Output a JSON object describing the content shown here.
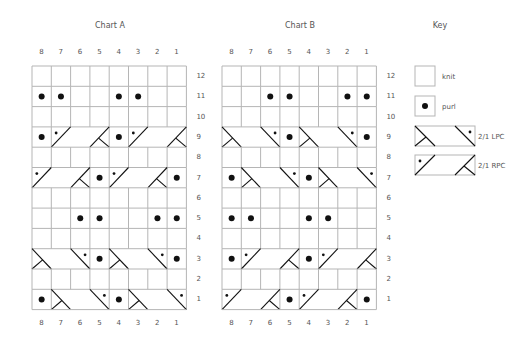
{
  "charts": [
    {
      "title": "Chart A",
      "columns": [
        "8",
        "7",
        "6",
        "5",
        "4",
        "3",
        "2",
        "1"
      ],
      "rows": [
        {
          "row": 12,
          "stitches": [
            "k",
            "k",
            "k",
            "k",
            "k",
            "k",
            "k",
            "k"
          ]
        },
        {
          "row": 11,
          "stitches": [
            "p",
            "p",
            "k",
            "k",
            "p",
            "p",
            "k",
            "k"
          ]
        },
        {
          "row": 10,
          "stitches": [
            "k",
            "k",
            "k",
            "k",
            "k",
            "k",
            "k",
            "k"
          ]
        },
        {
          "row": 9,
          "stitches": [
            "p",
            "RPC",
            "",
            "",
            "p",
            "RPC",
            "",
            ""
          ]
        },
        {
          "row": 8,
          "stitches": [
            "k",
            "k",
            "k",
            "k",
            "k",
            "k",
            "k",
            "k"
          ]
        },
        {
          "row": 7,
          "stitches": [
            "RPC",
            "",
            "",
            "p",
            "RPC",
            "",
            "",
            "p"
          ]
        },
        {
          "row": 6,
          "stitches": [
            "k",
            "k",
            "k",
            "k",
            "k",
            "k",
            "k",
            "k"
          ]
        },
        {
          "row": 5,
          "stitches": [
            "k",
            "k",
            "p",
            "p",
            "k",
            "k",
            "p",
            "p"
          ]
        },
        {
          "row": 4,
          "stitches": [
            "k",
            "k",
            "k",
            "k",
            "k",
            "k",
            "k",
            "k"
          ]
        },
        {
          "row": 3,
          "stitches": [
            "LPC",
            "",
            "",
            "p",
            "LPC",
            "",
            "",
            "p"
          ]
        },
        {
          "row": 2,
          "stitches": [
            "k",
            "k",
            "k",
            "k",
            "k",
            "k",
            "k",
            "k"
          ]
        },
        {
          "row": 1,
          "stitches": [
            "p",
            "LPC",
            "",
            "",
            "p",
            "LPC",
            "",
            ""
          ]
        }
      ]
    },
    {
      "title": "Chart B",
      "columns": [
        "8",
        "7",
        "6",
        "5",
        "4",
        "3",
        "2",
        "1"
      ],
      "rows": [
        {
          "row": 12,
          "stitches": [
            "k",
            "k",
            "k",
            "k",
            "k",
            "k",
            "k",
            "k"
          ]
        },
        {
          "row": 11,
          "stitches": [
            "k",
            "k",
            "p",
            "p",
            "k",
            "k",
            "p",
            "p"
          ]
        },
        {
          "row": 10,
          "stitches": [
            "k",
            "k",
            "k",
            "k",
            "k",
            "k",
            "k",
            "k"
          ]
        },
        {
          "row": 9,
          "stitches": [
            "LPC",
            "",
            "",
            "p",
            "LPC",
            "",
            "",
            "p"
          ]
        },
        {
          "row": 8,
          "stitches": [
            "k",
            "k",
            "k",
            "k",
            "k",
            "k",
            "k",
            "k"
          ]
        },
        {
          "row": 7,
          "stitches": [
            "p",
            "LPC",
            "",
            "",
            "p",
            "LPC",
            "",
            ""
          ]
        },
        {
          "row": 6,
          "stitches": [
            "k",
            "k",
            "k",
            "k",
            "k",
            "k",
            "k",
            "k"
          ]
        },
        {
          "row": 5,
          "stitches": [
            "p",
            "p",
            "k",
            "k",
            "p",
            "p",
            "k",
            "k"
          ]
        },
        {
          "row": 4,
          "stitches": [
            "k",
            "k",
            "k",
            "k",
            "k",
            "k",
            "k",
            "k"
          ]
        },
        {
          "row": 3,
          "stitches": [
            "p",
            "RPC",
            "",
            "",
            "p",
            "RPC",
            "",
            ""
          ]
        },
        {
          "row": 2,
          "stitches": [
            "k",
            "k",
            "k",
            "k",
            "k",
            "k",
            "k",
            "k"
          ]
        },
        {
          "row": 1,
          "stitches": [
            "RPC",
            "",
            "",
            "p",
            "RPC",
            "",
            "",
            "p"
          ]
        }
      ]
    }
  ],
  "key": {
    "title": "Key",
    "items": [
      {
        "symbol": "knit",
        "label": "knit"
      },
      {
        "symbol": "purl",
        "label": "purl"
      },
      {
        "symbol": "LPC",
        "label": "2/1 LPC"
      },
      {
        "symbol": "RPC",
        "label": "2/1 RPC"
      }
    ]
  },
  "colors": {
    "grid": "#b5b5b5",
    "ink": "#111111",
    "text": "#555555"
  }
}
